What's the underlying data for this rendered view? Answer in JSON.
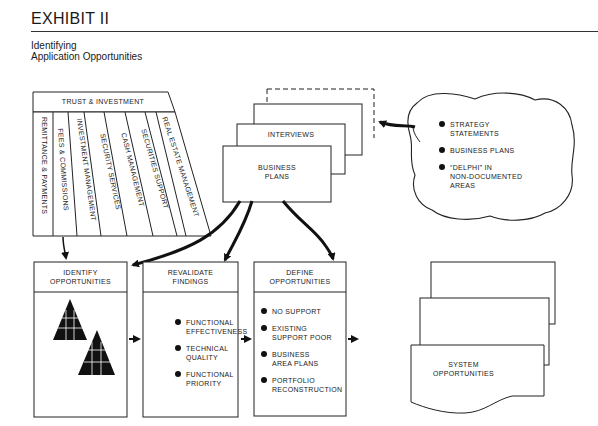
{
  "header": {
    "title": "EXHIBIT II",
    "subtitle_line1": "Identifying",
    "subtitle_line2": "Application Opportunities"
  },
  "trust_block": {
    "title": "TRUST & INVESTMENT",
    "columns": [
      "REMITTANCE & PAYMENTS",
      "FEES & COMMISSIONS",
      "INVESTMENT MANAGEMENT",
      "SECURITY SERVICES",
      "CASH MANAGEMENT",
      "SECURITIES SUPPORT",
      "REAL ESTATE MANAGEMENT"
    ]
  },
  "document_stack": {
    "front_line1": "BUSINESS",
    "front_line2": "PLANS",
    "second": "INTERVIEWS"
  },
  "cloud": {
    "items": [
      {
        "line1": "STRATEGY",
        "line2": "STATEMENTS"
      },
      {
        "line1": "BUSINESS PLANS",
        "line2": ""
      },
      {
        "line1": "“DELPHI” IN",
        "line2": "NON-DOCUMENTED",
        "line3": "AREAS"
      }
    ]
  },
  "process_boxes": [
    {
      "title_line1": "IDENTIFY",
      "title_line2": "OPPORTUNITIES",
      "icon": "pyramid-icon"
    },
    {
      "title_line1": "REVALIDATE",
      "title_line2": "FINDINGS",
      "bullets": [
        {
          "line1": "FUNCTIONAL",
          "line2": "EFFECTIVENESS"
        },
        {
          "line1": "TECHNICAL",
          "line2": "QUALITY"
        },
        {
          "line1": "FUNCTIONAL",
          "line2": "PRIORITY"
        }
      ]
    },
    {
      "title_line1": "DEFINE",
      "title_line2": "OPPORTUNITIES",
      "bullets": [
        {
          "line1": "NO SUPPORT",
          "line2": ""
        },
        {
          "line1": "EXISTING",
          "line2": "SUPPORT POOR"
        },
        {
          "line1": "BUSINESS",
          "line2": "AREA PLANS"
        },
        {
          "line1": "PORTFOLIO",
          "line2": "RECONSTRUCTION"
        }
      ]
    }
  ],
  "output_stack": {
    "line1": "SYSTEM",
    "line2": "OPPORTUNITIES"
  },
  "colors": {
    "ink": "#1a1a1a",
    "paper": "#ffffff"
  }
}
